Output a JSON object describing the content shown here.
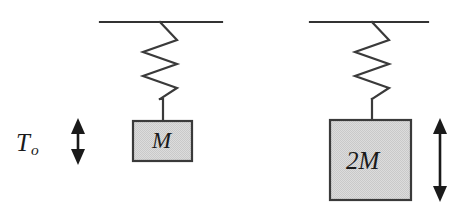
{
  "figure": {
    "background_color": "#ffffff",
    "line_color": "#333333",
    "block_fill_color": "#d4d4d4",
    "block_border_color": "#3a3a3a",
    "arrow_color": "#1a1a1a"
  },
  "annotations": {
    "period_symbol": "T",
    "period_subscript": "o"
  },
  "systems": [
    {
      "id": "left-system",
      "mass_label": "M",
      "mass_label_plain": "M",
      "ceiling": {
        "x1": 100,
        "x2": 222,
        "y": 22
      },
      "spring": {
        "anchor_x": 160,
        "top_y": 22,
        "coils": 4,
        "half_width": 17,
        "bottom_y": 99
      },
      "connector": {
        "x": 163,
        "y1": 99,
        "y2": 121
      },
      "block": {
        "x": 133,
        "y": 121,
        "width": 59,
        "height": 40
      },
      "amplitude_arrow": {
        "x": 78,
        "y_top": 120,
        "y_bottom": 163
      }
    },
    {
      "id": "right-system",
      "mass_label": "2M",
      "mass_label_plain": "2M",
      "ceiling": {
        "x1": 310,
        "x2": 428,
        "y": 22
      },
      "spring": {
        "anchor_x": 372,
        "top_y": 22,
        "coils": 4,
        "half_width": 17,
        "bottom_y": 99
      },
      "connector": {
        "x": 372,
        "y1": 99,
        "y2": 120
      },
      "block": {
        "x": 330,
        "y": 120,
        "width": 81,
        "height": 80
      },
      "amplitude_arrow": {
        "x": 440,
        "y_top": 120,
        "y_bottom": 200
      }
    }
  ]
}
